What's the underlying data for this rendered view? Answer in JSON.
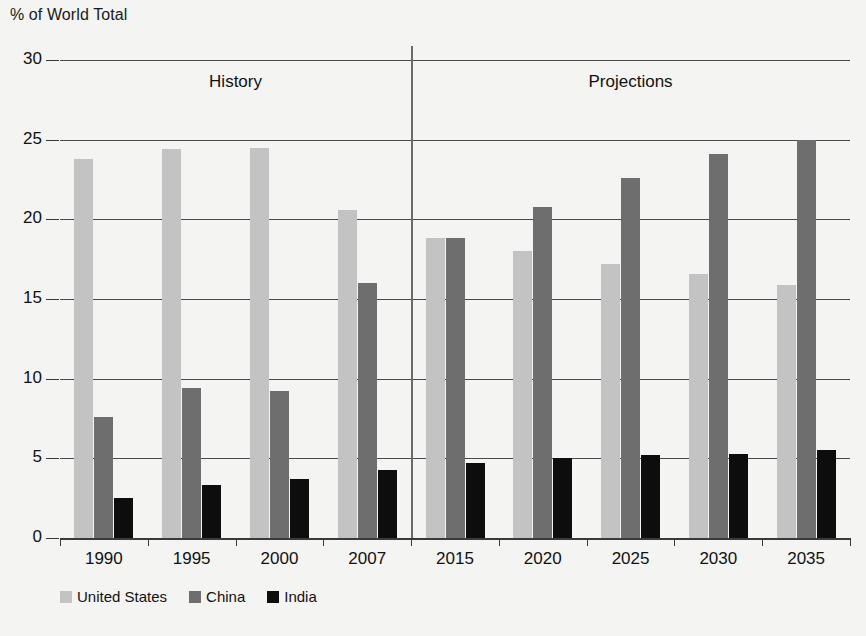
{
  "chart_data": {
    "type": "bar",
    "title": "",
    "ylabel": "% of World Total",
    "xlabel": "",
    "ylim": [
      0,
      30
    ],
    "yticks": [
      0,
      5,
      10,
      15,
      20,
      25,
      30
    ],
    "grid": true,
    "legend_position": "bottom-left",
    "categories": [
      "1990",
      "1995",
      "2000",
      "2007",
      "2015",
      "2020",
      "2025",
      "2030",
      "2035"
    ],
    "series": [
      {
        "name": "United States",
        "color": "#c3c3c3",
        "values": [
          23.8,
          24.4,
          24.5,
          20.6,
          18.8,
          18.0,
          17.2,
          16.6,
          15.9
        ]
      },
      {
        "name": "China",
        "color": "#6e6e6e",
        "values": [
          7.6,
          9.4,
          9.2,
          16.0,
          18.8,
          20.8,
          22.6,
          24.1,
          25.0
        ]
      },
      {
        "name": "India",
        "color": "#0d0d0d",
        "values": [
          2.5,
          3.3,
          3.7,
          4.3,
          4.7,
          5.0,
          5.2,
          5.3,
          5.5
        ]
      }
    ],
    "annotations": [
      {
        "text": "History",
        "x_category_span": [
          "1990",
          "2007"
        ]
      },
      {
        "text": "Projections",
        "x_category_span": [
          "2015",
          "2035"
        ]
      }
    ],
    "divider_after_category": "2007"
  },
  "legend": {
    "items": [
      {
        "label": "United States"
      },
      {
        "label": "China"
      },
      {
        "label": "India"
      }
    ]
  },
  "panels": {
    "history_label": "History",
    "projections_label": "Projections"
  },
  "axis": {
    "y_title": "% of World Total"
  }
}
